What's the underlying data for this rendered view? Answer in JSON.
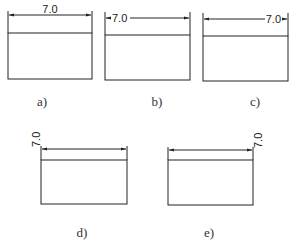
{
  "figure": {
    "panels": [
      {
        "id": "a",
        "caption": "a)",
        "dimension_value": "7.0",
        "text_placement": "centered-above"
      },
      {
        "id": "b",
        "caption": "b)",
        "dimension_value": "7.0",
        "text_placement": "left-inline"
      },
      {
        "id": "c",
        "caption": "c)",
        "dimension_value": "7.0",
        "text_placement": "right-inline"
      },
      {
        "id": "d",
        "caption": "d)",
        "dimension_value": "7.0",
        "text_placement": "left-outside-rotated"
      },
      {
        "id": "e",
        "caption": "e)",
        "dimension_value": "7.0",
        "text_placement": "right-outside-rotated"
      }
    ]
  }
}
